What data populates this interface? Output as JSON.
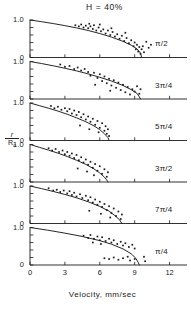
{
  "figure": {
    "title": "H  =  40%",
    "xlabel": "Velocity,  mm/sec",
    "ylabel_num": "r",
    "ylabel_den": "R",
    "ylabel_den_sub": "o"
  },
  "axes": {
    "y_top_label": "1.0",
    "y_bottom_label": "0",
    "x_ticks": [
      "0",
      "3",
      "6",
      "9",
      "12"
    ]
  },
  "chart_data": {
    "type": "scatter",
    "title": "H = 40%",
    "xlabel": "Velocity, mm/sec",
    "ylabel": "r/R0",
    "xlim": [
      0,
      13.5
    ],
    "ylim": [
      0,
      1.0
    ],
    "xticks": [
      0,
      3,
      6,
      9,
      12
    ],
    "yticks": [
      0,
      1.0
    ],
    "grid": false,
    "legend": "none",
    "panel_layout": "6 stacked panels sharing one x-axis",
    "panels": [
      {
        "label": "π/2",
        "curve": [
          [
            0.0,
            1.0
          ],
          [
            1.0,
            0.955
          ],
          [
            2.0,
            0.905
          ],
          [
            3.0,
            0.85
          ],
          [
            4.0,
            0.79
          ],
          [
            5.0,
            0.72
          ],
          [
            6.0,
            0.64
          ],
          [
            7.0,
            0.545
          ],
          [
            8.0,
            0.43
          ],
          [
            8.7,
            0.33
          ],
          [
            9.2,
            0.23
          ],
          [
            9.5,
            0.12
          ],
          [
            9.6,
            0.0
          ]
        ],
        "points": [
          [
            3.9,
            0.86
          ],
          [
            4.2,
            0.83
          ],
          [
            4.4,
            0.88
          ],
          [
            4.6,
            0.8
          ],
          [
            4.8,
            0.85
          ],
          [
            5.0,
            0.78
          ],
          [
            5.2,
            0.83
          ],
          [
            5.4,
            0.76
          ],
          [
            5.5,
            0.86
          ],
          [
            5.7,
            0.72
          ],
          [
            5.9,
            0.8
          ],
          [
            6.1,
            0.7
          ],
          [
            6.3,
            0.75
          ],
          [
            6.5,
            0.64
          ],
          [
            6.7,
            0.72
          ],
          [
            6.9,
            0.6
          ],
          [
            7.1,
            0.68
          ],
          [
            7.3,
            0.56
          ],
          [
            7.5,
            0.62
          ],
          [
            7.7,
            0.5
          ],
          [
            7.9,
            0.58
          ],
          [
            8.1,
            0.44
          ],
          [
            8.3,
            0.52
          ],
          [
            8.5,
            0.38
          ],
          [
            8.7,
            0.46
          ],
          [
            8.9,
            0.3
          ],
          [
            9.0,
            0.4
          ],
          [
            9.1,
            0.22
          ],
          [
            9.2,
            0.34
          ],
          [
            9.3,
            0.16
          ],
          [
            9.4,
            0.28
          ],
          [
            9.5,
            0.1
          ],
          [
            9.6,
            0.22
          ],
          [
            9.7,
            0.3
          ],
          [
            9.8,
            0.14
          ],
          [
            10.0,
            0.42
          ],
          [
            10.2,
            0.26
          ],
          [
            10.4,
            0.34
          ],
          [
            8.2,
            0.66
          ],
          [
            7.0,
            0.78
          ],
          [
            6.0,
            0.88
          ],
          [
            5.1,
            0.9
          ]
        ]
      },
      {
        "label": "3π/4",
        "curve": [
          [
            0.0,
            1.0
          ],
          [
            1.0,
            0.945
          ],
          [
            2.0,
            0.885
          ],
          [
            3.0,
            0.82
          ],
          [
            4.0,
            0.75
          ],
          [
            5.0,
            0.67
          ],
          [
            6.0,
            0.58
          ],
          [
            7.0,
            0.48
          ],
          [
            8.0,
            0.36
          ],
          [
            8.7,
            0.25
          ],
          [
            9.2,
            0.15
          ],
          [
            9.4,
            0.06
          ],
          [
            9.5,
            0.0
          ]
        ],
        "points": [
          [
            2.6,
            0.92
          ],
          [
            3.0,
            0.86
          ],
          [
            3.4,
            0.88
          ],
          [
            3.8,
            0.8
          ],
          [
            4.1,
            0.84
          ],
          [
            4.4,
            0.76
          ],
          [
            4.7,
            0.8
          ],
          [
            5.0,
            0.72
          ],
          [
            5.2,
            0.62
          ],
          [
            5.5,
            0.7
          ],
          [
            5.8,
            0.56
          ],
          [
            6.0,
            0.66
          ],
          [
            6.2,
            0.48
          ],
          [
            6.4,
            0.6
          ],
          [
            6.6,
            0.42
          ],
          [
            6.8,
            0.54
          ],
          [
            7.0,
            0.36
          ],
          [
            7.2,
            0.5
          ],
          [
            7.4,
            0.3
          ],
          [
            7.6,
            0.44
          ],
          [
            7.8,
            0.24
          ],
          [
            8.0,
            0.38
          ],
          [
            8.2,
            0.18
          ],
          [
            8.4,
            0.32
          ],
          [
            8.6,
            0.12
          ],
          [
            8.8,
            0.26
          ],
          [
            9.0,
            0.2
          ],
          [
            9.2,
            0.34
          ],
          [
            9.4,
            0.14
          ],
          [
            9.5,
            0.26
          ],
          [
            5.6,
            0.38
          ],
          [
            6.9,
            0.22
          ]
        ]
      },
      {
        "label": "5π/4",
        "curve": [
          [
            0.0,
            1.0
          ],
          [
            0.8,
            0.93
          ],
          [
            1.6,
            0.86
          ],
          [
            2.4,
            0.785
          ],
          [
            3.2,
            0.7
          ],
          [
            4.0,
            0.605
          ],
          [
            4.8,
            0.5
          ],
          [
            5.5,
            0.39
          ],
          [
            6.0,
            0.29
          ],
          [
            6.4,
            0.18
          ],
          [
            6.7,
            0.08
          ],
          [
            6.8,
            0.0
          ]
        ],
        "points": [
          [
            1.8,
            0.92
          ],
          [
            2.1,
            0.86
          ],
          [
            2.4,
            0.9
          ],
          [
            2.7,
            0.82
          ],
          [
            3.0,
            0.86
          ],
          [
            3.2,
            0.78
          ],
          [
            3.4,
            0.84
          ],
          [
            3.6,
            0.72
          ],
          [
            3.8,
            0.8
          ],
          [
            4.0,
            0.68
          ],
          [
            4.2,
            0.76
          ],
          [
            4.4,
            0.62
          ],
          [
            4.6,
            0.7
          ],
          [
            4.8,
            0.56
          ],
          [
            5.0,
            0.64
          ],
          [
            5.2,
            0.5
          ],
          [
            5.4,
            0.58
          ],
          [
            5.6,
            0.42
          ],
          [
            5.8,
            0.52
          ],
          [
            6.0,
            0.34
          ],
          [
            6.2,
            0.46
          ],
          [
            6.4,
            0.26
          ],
          [
            6.5,
            0.38
          ],
          [
            6.6,
            0.18
          ],
          [
            6.7,
            0.3
          ],
          [
            6.8,
            0.12
          ],
          [
            5.9,
            0.22
          ],
          [
            5.1,
            0.3
          ],
          [
            4.3,
            0.4
          ]
        ]
      },
      {
        "label": "3π/2",
        "curve": [
          [
            0.0,
            1.0
          ],
          [
            0.8,
            0.925
          ],
          [
            1.6,
            0.85
          ],
          [
            2.4,
            0.77
          ],
          [
            3.2,
            0.68
          ],
          [
            4.0,
            0.58
          ],
          [
            4.8,
            0.47
          ],
          [
            5.5,
            0.35
          ],
          [
            6.0,
            0.24
          ],
          [
            6.4,
            0.13
          ],
          [
            6.6,
            0.05
          ],
          [
            6.7,
            0.0
          ]
        ],
        "points": [
          [
            1.6,
            0.9
          ],
          [
            1.9,
            0.84
          ],
          [
            2.2,
            0.88
          ],
          [
            2.5,
            0.8
          ],
          [
            2.8,
            0.84
          ],
          [
            3.0,
            0.74
          ],
          [
            3.2,
            0.8
          ],
          [
            3.4,
            0.7
          ],
          [
            3.6,
            0.76
          ],
          [
            3.8,
            0.64
          ],
          [
            4.0,
            0.72
          ],
          [
            4.2,
            0.58
          ],
          [
            4.4,
            0.66
          ],
          [
            4.6,
            0.52
          ],
          [
            4.8,
            0.6
          ],
          [
            5.0,
            0.46
          ],
          [
            5.2,
            0.54
          ],
          [
            5.4,
            0.38
          ],
          [
            5.6,
            0.48
          ],
          [
            5.8,
            0.3
          ],
          [
            6.0,
            0.42
          ],
          [
            6.2,
            0.22
          ],
          [
            6.4,
            0.34
          ],
          [
            6.6,
            0.14
          ],
          [
            6.7,
            0.26
          ],
          [
            5.5,
            0.18
          ],
          [
            4.9,
            0.28
          ],
          [
            4.1,
            0.36
          ]
        ]
      },
      {
        "label": "7π/4",
        "curve": [
          [
            0.0,
            1.0
          ],
          [
            1.0,
            0.93
          ],
          [
            2.0,
            0.855
          ],
          [
            3.0,
            0.775
          ],
          [
            4.0,
            0.685
          ],
          [
            5.0,
            0.58
          ],
          [
            6.0,
            0.455
          ],
          [
            6.8,
            0.33
          ],
          [
            7.3,
            0.21
          ],
          [
            7.7,
            0.1
          ],
          [
            7.9,
            0.0
          ]
        ],
        "points": [
          [
            1.6,
            0.94
          ],
          [
            2.0,
            0.88
          ],
          [
            2.3,
            0.9
          ],
          [
            2.6,
            0.84
          ],
          [
            2.9,
            0.88
          ],
          [
            3.2,
            0.8
          ],
          [
            3.4,
            0.86
          ],
          [
            3.6,
            0.76
          ],
          [
            3.8,
            0.82
          ],
          [
            4.0,
            0.72
          ],
          [
            4.3,
            0.78
          ],
          [
            4.5,
            0.68
          ],
          [
            4.8,
            0.74
          ],
          [
            5.0,
            0.62
          ],
          [
            5.2,
            0.7
          ],
          [
            5.4,
            0.56
          ],
          [
            5.6,
            0.64
          ],
          [
            5.8,
            0.5
          ],
          [
            6.0,
            0.58
          ],
          [
            6.2,
            0.44
          ],
          [
            6.4,
            0.52
          ],
          [
            6.6,
            0.36
          ],
          [
            6.8,
            0.46
          ],
          [
            7.0,
            0.28
          ],
          [
            7.2,
            0.4
          ],
          [
            7.4,
            0.2
          ],
          [
            7.6,
            0.32
          ],
          [
            7.8,
            0.12
          ],
          [
            7.9,
            0.24
          ],
          [
            6.9,
            0.16
          ],
          [
            6.1,
            0.26
          ],
          [
            5.1,
            0.34
          ]
        ]
      },
      {
        "label": "π/4",
        "curve": [
          [
            0.0,
            1.0
          ],
          [
            1.5,
            0.93
          ],
          [
            3.0,
            0.85
          ],
          [
            4.5,
            0.76
          ],
          [
            6.0,
            0.65
          ],
          [
            7.0,
            0.555
          ],
          [
            8.0,
            0.43
          ],
          [
            8.7,
            0.3
          ],
          [
            9.1,
            0.18
          ],
          [
            9.3,
            0.07
          ],
          [
            9.4,
            0.0
          ]
        ],
        "points": [
          [
            4.6,
            0.78
          ],
          [
            5.0,
            0.72
          ],
          [
            5.2,
            0.8
          ],
          [
            5.5,
            0.7
          ],
          [
            5.8,
            0.76
          ],
          [
            6.0,
            0.66
          ],
          [
            6.2,
            0.74
          ],
          [
            6.5,
            0.64
          ],
          [
            6.8,
            0.7
          ],
          [
            7.0,
            0.6
          ],
          [
            7.2,
            0.66
          ],
          [
            7.5,
            0.56
          ],
          [
            7.8,
            0.62
          ],
          [
            8.0,
            0.52
          ],
          [
            8.2,
            0.58
          ],
          [
            8.5,
            0.48
          ],
          [
            8.8,
            0.54
          ],
          [
            9.0,
            0.44
          ],
          [
            6.4,
            0.18
          ],
          [
            6.8,
            0.16
          ],
          [
            7.2,
            0.2
          ],
          [
            7.6,
            0.14
          ],
          [
            8.0,
            0.18
          ],
          [
            8.4,
            0.22
          ],
          [
            8.6,
            0.12
          ],
          [
            9.0,
            0.16
          ],
          [
            9.8,
            0.22
          ],
          [
            9.9,
            0.1
          ],
          [
            5.4,
            0.6
          ],
          [
            6.1,
            0.56
          ]
        ]
      }
    ]
  }
}
